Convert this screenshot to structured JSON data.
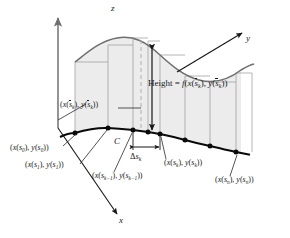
{
  "figure": {
    "colors": {
      "axis": "#7a7a7a",
      "curve": "#000000",
      "surface_fill": "#ececec",
      "surface_edge": "#9a9a9a",
      "top_curve": "#6e6e6e",
      "leader": "#4a4a4a",
      "text": "#1a1a1a",
      "background": "#ffffff"
    },
    "axes": [
      {
        "id": "z",
        "label": "z",
        "label_x": 113,
        "label_y": 8
      },
      {
        "id": "y",
        "label": "y",
        "label_x": 248,
        "label_y": 40
      },
      {
        "id": "x",
        "label": "x",
        "label_x": 121,
        "label_y": 222
      }
    ],
    "curve_label": {
      "text": "C",
      "x": 116,
      "y": 137
    },
    "height_label": {
      "prefix": "Height",
      "equals": "=",
      "fn": "f",
      "x_of": "x",
      "y_of": "y",
      "s_bar": "s",
      "sub_k": "k",
      "x": 148,
      "y": 84
    },
    "delta_label": {
      "delta": "Δ",
      "s": "s",
      "sub_k": "k",
      "x": 130,
      "y": 158
    },
    "point_labels": [
      {
        "id": "s0",
        "x_fn": "x",
        "y_fn": "y",
        "arg": "s",
        "sub": "0",
        "bar": false,
        "x": 12,
        "y": 148
      },
      {
        "id": "s1",
        "x_fn": "x",
        "y_fn": "y",
        "arg": "s",
        "sub": "1",
        "bar": false,
        "x": 29,
        "y": 166
      },
      {
        "id": "skm1",
        "x_fn": "x",
        "y_fn": "y",
        "arg": "s",
        "sub": "k−1",
        "bar": false,
        "x": 96,
        "y": 176
      },
      {
        "id": "sk",
        "x_fn": "x",
        "y_fn": "y",
        "arg": "s",
        "sub": "k",
        "bar": false,
        "x": 168,
        "y": 163
      },
      {
        "id": "sn",
        "x_fn": "x",
        "y_fn": "y",
        "arg": "s",
        "sub": "n",
        "bar": false,
        "x": 219,
        "y": 180
      },
      {
        "id": "skbar",
        "x_fn": "x",
        "y_fn": "y",
        "arg": "s",
        "sub": "k",
        "bar": true,
        "x": 60,
        "y": 105
      }
    ],
    "partition_points": [
      {
        "x": 75,
        "y": 133
      },
      {
        "x": 108,
        "y": 128
      },
      {
        "x": 133,
        "y": 130
      },
      {
        "x": 148,
        "y": 132
      },
      {
        "x": 160,
        "y": 134
      },
      {
        "x": 185,
        "y": 140
      },
      {
        "x": 210,
        "y": 146
      },
      {
        "x": 236,
        "y": 152
      }
    ]
  }
}
